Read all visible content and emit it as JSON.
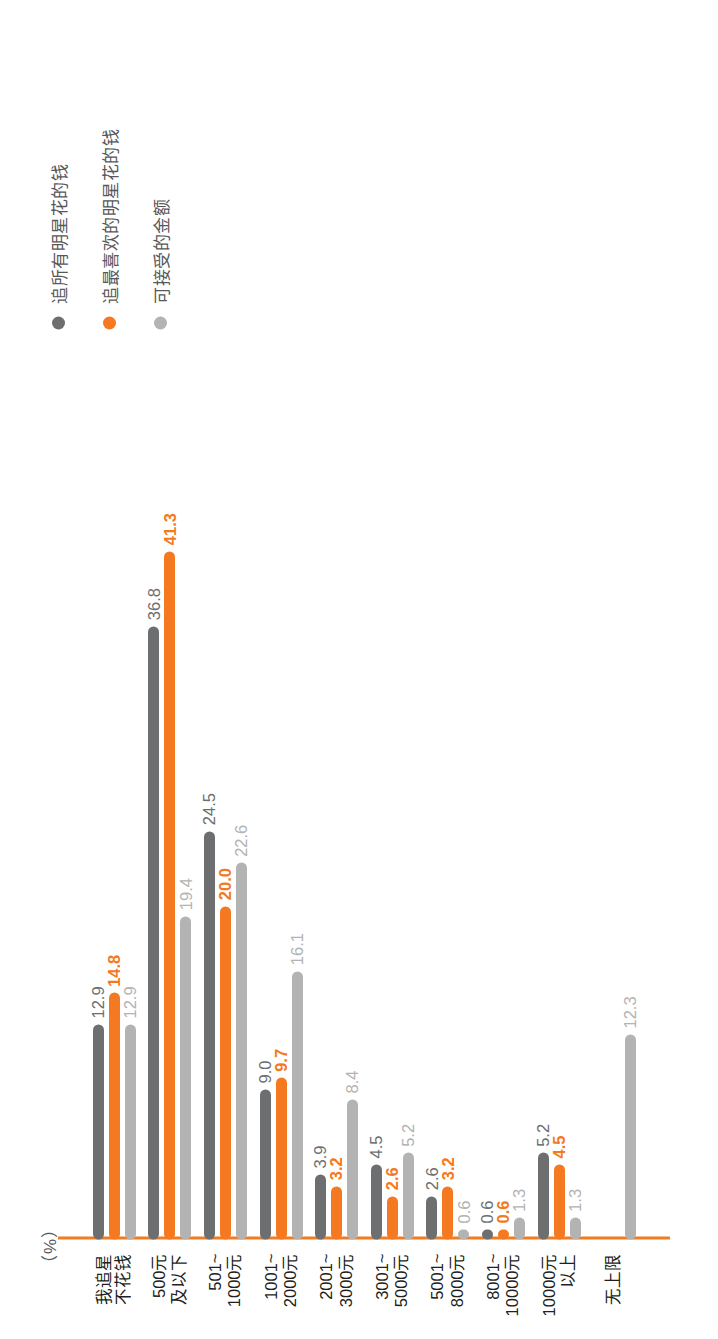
{
  "chart_data": {
    "type": "bar",
    "orientation": "horizontal",
    "title": "",
    "xlabel": "",
    "ylabel": "",
    "unit_label": "（%）",
    "grid": false,
    "legend_position": "top-right",
    "axis_color": "#f07d22",
    "categories": [
      "我追星\n不花钱",
      "500元\n及以下",
      "501~\n1000元",
      "1001~\n2000元",
      "2001~\n3000元",
      "3001~\n5000元",
      "5001~\n8000元",
      "8001~\n10000元",
      "10000元\n以上",
      "无上限"
    ],
    "series": [
      {
        "name": "追所有明星花的钱",
        "color": "#6d6e70",
        "values": [
          12.9,
          36.8,
          24.5,
          9.0,
          3.9,
          4.5,
          2.6,
          0.6,
          5.2,
          null
        ],
        "labels": [
          "12.9",
          "36.8",
          "24.5",
          "9.0",
          "3.9",
          "4.5",
          "2.6",
          "0.6",
          "5.2",
          ""
        ]
      },
      {
        "name": "追最喜欢的明星花的钱",
        "color": "#f47920",
        "values": [
          14.8,
          41.3,
          20.0,
          9.7,
          3.2,
          2.6,
          3.2,
          0.6,
          4.5,
          null
        ],
        "labels": [
          "14.8",
          "41.3",
          "20.0",
          "9.7",
          "3.2",
          "2.6",
          "3.2",
          "0.6",
          "4.5",
          ""
        ]
      },
      {
        "name": "可接受的金额",
        "color": "#b3b3b3",
        "values": [
          12.9,
          19.4,
          22.6,
          16.1,
          8.4,
          5.2,
          0.6,
          1.3,
          1.3,
          12.3
        ],
        "labels": [
          "12.9",
          "19.4",
          "22.6",
          "16.1",
          "8.4",
          "5.2",
          "0.6",
          "1.3",
          "1.3",
          "12.3"
        ]
      }
    ],
    "xlim": [
      0,
      45
    ]
  },
  "legend": {
    "items": [
      {
        "label": "追所有明星花的钱",
        "color": "#6d6e70"
      },
      {
        "label": "追最喜欢的明星花的钱",
        "color": "#f47920"
      },
      {
        "label": "可接受的金额",
        "color": "#b3b3b3"
      }
    ]
  }
}
